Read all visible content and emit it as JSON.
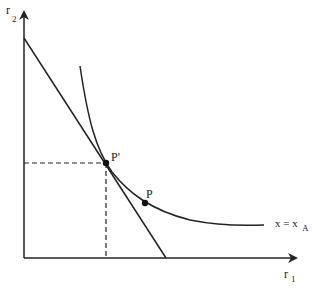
{
  "diagram": {
    "type": "isoquant-tangency",
    "axes": {
      "y_label": "r",
      "y_sub": "2",
      "x_label": "r",
      "x_sub": "1"
    },
    "curve": {
      "label": "x = x",
      "label_sub": "A"
    },
    "points": [
      {
        "name": "P'",
        "label": "P'",
        "x": 106,
        "y": 163
      },
      {
        "name": "P",
        "label": "P",
        "x": 145,
        "y": 203
      }
    ],
    "line": {
      "from": [
        24,
        38
      ],
      "to": [
        166,
        258
      ]
    },
    "colors": {
      "stroke": "#222222",
      "background": "#ffffff"
    }
  }
}
